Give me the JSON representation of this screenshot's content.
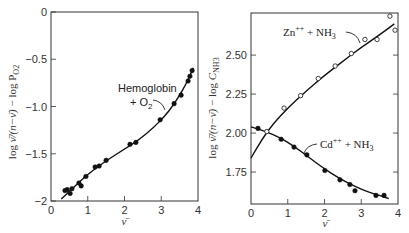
{
  "chart_data": [
    {
      "type": "scatter",
      "title": "",
      "xlabel": "ν̄",
      "ylabel": "log ν̄/(n − ν̄) − log P_O2",
      "xlim": [
        0,
        4
      ],
      "ylim": [
        -2,
        0
      ],
      "xticks": [
        0,
        1,
        2,
        3,
        4
      ],
      "xtick_labels": [
        "0",
        "1",
        "2",
        "3",
        "4"
      ],
      "yticks": [
        0,
        -0.5,
        -1.0,
        -1.5,
        -2
      ],
      "ytick_labels": [
        "0",
        "−0.5",
        "−1.0",
        "−1.5",
        "−2"
      ],
      "grid": false,
      "annotations": [
        {
          "text": "Hemoglobin",
          "line2": "+ O2",
          "x": 2.55,
          "y": -0.93
        }
      ],
      "series": [
        {
          "name": "Hemoglobin + O2",
          "marker": "filled-circle",
          "x": [
            0.38,
            0.44,
            0.52,
            0.57,
            0.76,
            0.82,
            0.95,
            1.2,
            1.31,
            1.5,
            2.15,
            2.31,
            2.97,
            3.35,
            3.54,
            3.73,
            3.78,
            3.84
          ],
          "y": [
            -1.89,
            -1.88,
            -1.92,
            -1.87,
            -1.81,
            -1.84,
            -1.74,
            -1.64,
            -1.63,
            -1.57,
            -1.4,
            -1.38,
            -1.14,
            -0.97,
            -0.88,
            -0.73,
            -0.68,
            -0.62
          ],
          "fit_curve": {
            "x": [
              0.28,
              0.5,
              0.8,
              1.0,
              1.3,
              1.6,
              2.0,
              2.4,
              2.8,
              3.1,
              3.3,
              3.5,
              3.65,
              3.8,
              3.87
            ],
            "y": [
              -1.98,
              -1.9,
              -1.79,
              -1.72,
              -1.63,
              -1.55,
              -1.45,
              -1.35,
              -1.22,
              -1.1,
              -1.0,
              -0.88,
              -0.78,
              -0.66,
              -0.59
            ]
          }
        }
      ]
    },
    {
      "type": "scatter",
      "title": "",
      "xlabel": "ν̄",
      "ylabel": "log ν̄/(n − ν̄) − log C_NH3",
      "xlim": [
        0,
        4
      ],
      "ylim": [
        1.545,
        2.77
      ],
      "xticks": [
        0,
        1,
        2,
        3,
        4
      ],
      "xtick_labels": [
        "0",
        "1",
        "2",
        "3",
        "4"
      ],
      "yticks": [
        2.5,
        2.25,
        2.0,
        1.75
      ],
      "ytick_labels": [
        "2.50",
        "2.25",
        "2.00",
        "1.75"
      ],
      "grid": false,
      "annotations": [
        {
          "text": "Zn++ + NH3",
          "x": 0.85,
          "y": 2.63
        },
        {
          "text": "Cd++ + NH3",
          "x": 1.85,
          "y": 1.95
        }
      ],
      "series": [
        {
          "name": "Zn++ + NH3",
          "marker": "open-circle",
          "x": [
            0.43,
            0.9,
            1.35,
            1.83,
            2.29,
            2.73,
            3.1,
            3.43,
            3.78,
            3.92
          ],
          "y": [
            2.01,
            2.16,
            2.24,
            2.35,
            2.43,
            2.51,
            2.6,
            2.6,
            2.75,
            2.66
          ],
          "fit_curve": {
            "x": [
              0,
              0.3,
              0.6,
              1.0,
              1.5,
              2.0,
              2.5,
              3.0,
              3.5,
              3.9
            ],
            "y": [
              1.84,
              1.96,
              2.06,
              2.16,
              2.27,
              2.37,
              2.46,
              2.55,
              2.63,
              2.7
            ]
          }
        },
        {
          "name": "Cd++ + NH3",
          "marker": "filled-circle",
          "x": [
            0.19,
            0.82,
            1.17,
            1.52,
            2.01,
            2.42,
            2.69,
            2.83,
            3.4,
            3.62
          ],
          "y": [
            2.03,
            1.96,
            1.91,
            1.86,
            1.76,
            1.7,
            1.67,
            1.63,
            1.6,
            1.6
          ],
          "fit_curve": {
            "x": [
              0,
              0.4,
              0.8,
              1.2,
              1.6,
              2.0,
              2.4,
              2.8,
              3.2,
              3.5,
              3.75
            ],
            "y": [
              2.04,
              2.01,
              1.97,
              1.91,
              1.84,
              1.77,
              1.71,
              1.66,
              1.62,
              1.6,
              1.58
            ]
          }
        }
      ]
    }
  ]
}
